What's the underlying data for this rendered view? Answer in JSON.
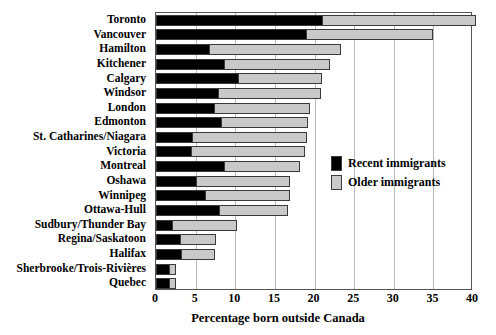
{
  "chart_data": {
    "type": "bar",
    "orientation": "horizontal",
    "stacked": true,
    "title": "",
    "xlabel": "Percentage born outside Canada",
    "ylabel": "",
    "xlim": [
      0,
      40
    ],
    "xticks": [
      0,
      5,
      10,
      15,
      20,
      25,
      30,
      35,
      40
    ],
    "xtick_labels": [
      "0",
      "5",
      "10",
      "15",
      "20",
      "25",
      "30",
      "35",
      "40"
    ],
    "grid": true,
    "grid_axis": "x",
    "legend_position": "center-right",
    "categories": [
      "Toronto",
      "Vancouver",
      "Hamilton",
      "Kitchener",
      "Calgary",
      "Windsor",
      "London",
      "Edmonton",
      "St. Catharines/Niagara",
      "Victoria",
      "Montreal",
      "Oshawa",
      "Winnipeg",
      "Ottawa-Hull",
      "Sudbury/Thunder Bay",
      "Regina/Saskatoon",
      "Halifax",
      "Sherbrooke/Trois-Rivières",
      "Quebec"
    ],
    "series": [
      {
        "name": "Recent immigrants",
        "color": "#000000",
        "values": [
          20.8,
          18.8,
          6.6,
          8.4,
          10.2,
          7.7,
          7.2,
          8.1,
          4.4,
          4.3,
          8.4,
          4.9,
          6.1,
          7.8,
          1.9,
          2.9,
          3.0,
          1.5,
          1.5
        ]
      },
      {
        "name": "Older immigrants",
        "color": "#c9c9c9",
        "values": [
          19.6,
          16.1,
          16.8,
          13.5,
          10.7,
          13.1,
          12.2,
          11.1,
          14.6,
          14.5,
          9.8,
          12.0,
          10.8,
          8.8,
          8.3,
          4.7,
          4.4,
          1.0,
          1.0
        ]
      }
    ],
    "totals": [
      40.4,
      34.9,
      23.4,
      21.9,
      20.9,
      20.8,
      19.4,
      19.2,
      19.0,
      18.8,
      18.2,
      16.9,
      16.9,
      16.6,
      10.2,
      7.6,
      7.4,
      2.5,
      2.5
    ]
  },
  "legend": {
    "items": [
      {
        "label": "Recent immigrants",
        "swatch": "black-square-icon"
      },
      {
        "label": "Older immigrants",
        "swatch": "grey-square-icon"
      }
    ]
  }
}
